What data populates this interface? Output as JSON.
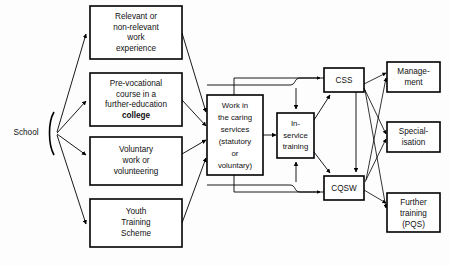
{
  "diagram": {
    "background_color": "#fdfdfd",
    "line_color": "#000000",
    "box_fill": "#ffffff",
    "start": {
      "label": "School",
      "name": "school-label"
    },
    "route_boxes": [
      {
        "id": "work-experience",
        "lines": [
          "Relevant or",
          "non-relevant",
          "work",
          "experience"
        ]
      },
      {
        "id": "pre-vocational-course",
        "lines": [
          "Pre-vocational",
          "course in a",
          "further-education",
          "college"
        ],
        "bold_line_index": 3
      },
      {
        "id": "voluntary-work",
        "lines": [
          "Voluntary",
          "work or",
          "volunteering"
        ]
      },
      {
        "id": "youth-training-scheme",
        "lines": [
          "Youth",
          "Training",
          "Scheme"
        ]
      }
    ],
    "caring_services": {
      "id": "work-in-caring-services",
      "lines": [
        "Work in",
        "the caring",
        "services",
        "(statutory",
        "or",
        "voluntary)"
      ]
    },
    "in_service_training": {
      "id": "in-service-training",
      "lines": [
        "In-",
        "service",
        "training"
      ]
    },
    "qualifications": [
      {
        "id": "css",
        "lines": [
          "CSS"
        ]
      },
      {
        "id": "cqsw",
        "lines": [
          "CQSW"
        ]
      }
    ],
    "outcomes": [
      {
        "id": "management",
        "lines": [
          "Manage-",
          "ment"
        ]
      },
      {
        "id": "specialisation",
        "lines": [
          "Special-",
          "isation"
        ]
      },
      {
        "id": "further-training",
        "lines": [
          "Further",
          "training",
          "(PQS)"
        ]
      }
    ]
  }
}
